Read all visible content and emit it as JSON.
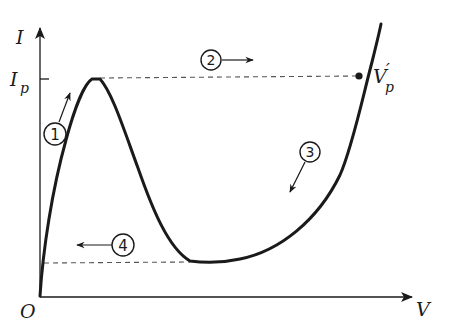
{
  "diagram": {
    "type": "tunnel-diode I-V characteristic",
    "axes": {
      "y_label": "I",
      "x_label": "V",
      "origin_label": "O"
    },
    "peak_current_label": {
      "main": "I",
      "sub": "p"
    },
    "switch_point_label": {
      "main": "V",
      "prime": "′",
      "sub": "p"
    },
    "steps": [
      {
        "id": "1",
        "label": "1",
        "direction": "up along rising branch"
      },
      {
        "id": "2",
        "label": "2",
        "direction": "right (jump at peak current)"
      },
      {
        "id": "3",
        "label": "3",
        "direction": "down along high-voltage branch"
      },
      {
        "id": "4",
        "label": "4",
        "direction": "left (jump at valley current)"
      }
    ],
    "colors": {
      "ink": "#1a1a1a",
      "background": "#ffffff"
    }
  }
}
